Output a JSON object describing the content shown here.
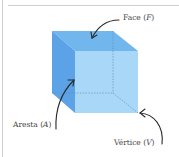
{
  "diagram": {
    "colors": {
      "top_face": "#72b6ee",
      "left_face": "#5ba3e6",
      "front_face": "#a9d7f8",
      "hidden_edge": "#5a8fc0",
      "arrow": "#2a2a2a",
      "frame": "#cccccc",
      "label_text": "#444444"
    },
    "labels": {
      "face": {
        "word": "Face",
        "open": "(",
        "var": "F",
        "close": ")"
      },
      "aresta": {
        "word": "Aresta",
        "open": "(",
        "var": "A",
        "close": ")"
      },
      "vertice": {
        "word": "Vértice",
        "open": "(",
        "var": "V",
        "close": ")"
      }
    }
  }
}
